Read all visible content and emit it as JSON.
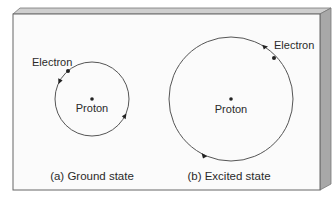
{
  "figure": {
    "panels": [
      {
        "id": "a",
        "caption": "(a) Ground state",
        "nucleus_label": "Proton",
        "particle_label": "Electron",
        "orbit": {
          "cx": 92,
          "cy": 99,
          "r": 37
        }
      },
      {
        "id": "b",
        "caption": "(b) Excited state",
        "nucleus_label": "Proton",
        "particle_label": "Electron",
        "orbit": {
          "cx": 231,
          "cy": 99,
          "r": 62
        }
      }
    ],
    "colors": {
      "panel_face": "#fbfbfb",
      "panel_top_edge": "#c9c9c9",
      "panel_side_edge": "#a9a9a9",
      "outline": "#555555",
      "orbit_stroke": "#555555",
      "dot": "#222222",
      "text": "#2a2a2a"
    }
  }
}
